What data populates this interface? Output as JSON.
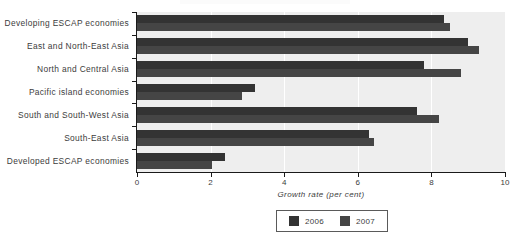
{
  "chart_data": {
    "type": "bar",
    "orientation": "horizontal",
    "title": "",
    "xlabel": "Growth rate (per cent)",
    "ylabel": "",
    "xlim": [
      0,
      10
    ],
    "xticks": [
      0,
      2,
      4,
      6,
      8,
      10
    ],
    "xtick_labels": [
      "0",
      "2",
      "4",
      "6",
      "8",
      "10"
    ],
    "grid": true,
    "grid_axis": "x",
    "legend_position": "bottom",
    "categories": [
      "Developing ESCAP economies",
      "East and North-East Asia",
      "North and Central Asia",
      "Pacific island economies",
      "South and South-West Asia",
      "South-East Asia",
      "Developed ESCAP economies"
    ],
    "series": [
      {
        "name": "2006",
        "color": "#333333",
        "values": [
          8.35,
          9.0,
          7.8,
          3.2,
          7.6,
          6.3,
          2.4
        ]
      },
      {
        "name": "2007",
        "color": "#454545",
        "values": [
          8.5,
          9.3,
          8.8,
          2.85,
          8.2,
          6.45,
          2.05
        ]
      }
    ]
  },
  "legend": {
    "entries": [
      {
        "label": "2006"
      },
      {
        "label": "2007"
      }
    ]
  },
  "colors": {
    "series_2006": "#333333",
    "series_2007": "#454545",
    "plot_background": "#eeeeee",
    "gridline": "#ffffff",
    "axis": "#1a1a1a",
    "text": "#3c3c3c"
  }
}
